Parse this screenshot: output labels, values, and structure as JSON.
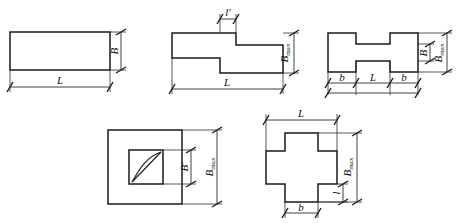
{
  "figure": {
    "background_color": "#ffffff",
    "line_color": "#1a1a1a",
    "dimension_color": "#2b2b2b"
  },
  "shapes": [
    {
      "id": "rectangle",
      "name": "Rectangle footing",
      "labels": {
        "width": "L",
        "height": "B"
      }
    },
    {
      "id": "stepped-z",
      "name": "Stepped Z-shaped footing",
      "labels": {
        "step": "l'",
        "height": "B",
        "height_sub": "max",
        "width": "L"
      }
    },
    {
      "id": "i-beam",
      "name": "I-shaped dumbbell footing",
      "labels": {
        "flange_left": "b",
        "web": "L",
        "flange_right": "b",
        "web_height": "B",
        "height": "B",
        "height_sub": "max"
      }
    },
    {
      "id": "hollow-square",
      "name": "Hollow square ring footing",
      "labels": {
        "inner": "B'",
        "outer": "B",
        "outer_sub": "max"
      }
    },
    {
      "id": "cross",
      "name": "Cross shaped footing",
      "labels": {
        "width": "L",
        "height": "B",
        "height_sub": "max",
        "arm": "l",
        "base": "b"
      }
    }
  ]
}
